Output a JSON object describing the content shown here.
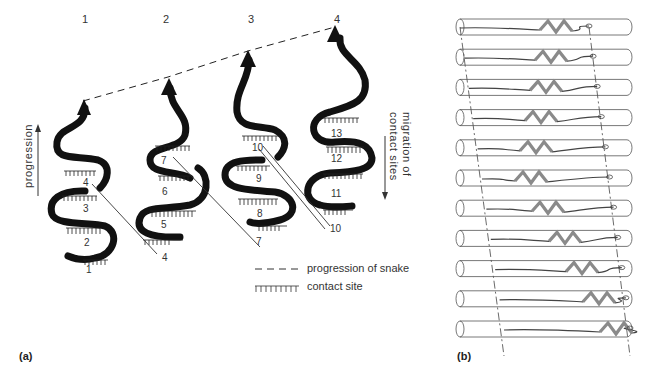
{
  "panel_a": {
    "label": "(a)",
    "stage_labels": [
      "1",
      "2",
      "3",
      "4"
    ],
    "contact_numbers": {
      "snake1": [
        "4",
        "3",
        "2",
        "1"
      ],
      "snake2": [
        "7",
        "6",
        "5",
        "4"
      ],
      "snake3": [
        "10",
        "9",
        "8",
        "7"
      ],
      "snake4": [
        "13",
        "12",
        "11",
        "10"
      ]
    },
    "left_axis_label": "progression",
    "right_axis_label_line1": "migration of",
    "right_axis_label_line2": "contact sites",
    "legend": [
      {
        "symbol": "dashed-line",
        "text": "progression of snake"
      },
      {
        "symbol": "contact-comb",
        "text": "contact site"
      }
    ]
  },
  "panel_b": {
    "label": "(b)",
    "tube_count": 11
  },
  "colors": {
    "ink": "#111111",
    "text": "#333333",
    "tube_stroke": "#555555",
    "snake_fill": "#8a8a8a"
  }
}
